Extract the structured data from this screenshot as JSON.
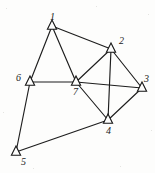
{
  "figure": {
    "type": "graph-diagram",
    "background_color": "#fdfdfc",
    "edge_color": "#1d1d1d",
    "node_fill_color": "#fdfdfc",
    "node_stroke_color": "#141414",
    "label_color": "#1a1a1a",
    "marker_shape": "triangle-up-open",
    "width": 155,
    "height": 173
  },
  "chart_data": {
    "type": "scatter",
    "title": "",
    "xlabel": "",
    "ylabel": "",
    "grid": false,
    "legend": "none",
    "nodes": [
      {
        "id": "1",
        "label": "1",
        "x": 52,
        "y": 26,
        "label_dx": -2,
        "label_dy": -14
      },
      {
        "id": "2",
        "label": "2",
        "x": 111,
        "y": 49,
        "label_dx": 8,
        "label_dy": -13
      },
      {
        "id": "3",
        "label": "3",
        "x": 142,
        "y": 88,
        "label_dx": 2,
        "label_dy": -14
      },
      {
        "id": "4",
        "label": "4",
        "x": 108,
        "y": 120,
        "label_dx": -2,
        "label_dy": 6
      },
      {
        "id": "5",
        "label": "5",
        "x": 16,
        "y": 152,
        "label_dx": 5,
        "label_dy": 5
      },
      {
        "id": "6",
        "label": "6",
        "x": 30,
        "y": 82,
        "label_dx": -14,
        "label_dy": -9
      },
      {
        "id": "7",
        "label": "7",
        "x": 76,
        "y": 82,
        "label_dx": -3,
        "label_dy": 5
      }
    ],
    "edges": [
      {
        "source": "1",
        "target": "2"
      },
      {
        "source": "1",
        "target": "6"
      },
      {
        "source": "1",
        "target": "7"
      },
      {
        "source": "2",
        "target": "3"
      },
      {
        "source": "2",
        "target": "4"
      },
      {
        "source": "2",
        "target": "7"
      },
      {
        "source": "3",
        "target": "4"
      },
      {
        "source": "3",
        "target": "7"
      },
      {
        "source": "4",
        "target": "5"
      },
      {
        "source": "4",
        "target": "7"
      },
      {
        "source": "5",
        "target": "6"
      },
      {
        "source": "6",
        "target": "7"
      }
    ],
    "node_count": 7,
    "edge_count": 12
  },
  "noise_specks": [
    {
      "x": 6,
      "y": 8,
      "d": 1
    },
    {
      "x": 148,
      "y": 14,
      "d": 1
    },
    {
      "x": 120,
      "y": 166,
      "d": 1
    },
    {
      "x": 33,
      "y": 168,
      "d": 1
    },
    {
      "x": 96,
      "y": 6,
      "d": 1
    },
    {
      "x": 3,
      "y": 112,
      "d": 1
    },
    {
      "x": 151,
      "y": 130,
      "d": 1
    }
  ]
}
